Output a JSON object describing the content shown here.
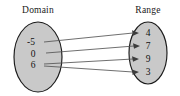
{
  "diagram": {
    "type": "mapping-diagram",
    "domain_label": "Domain",
    "range_label": "Range",
    "domain_elements": [
      "-5",
      "0",
      "6"
    ],
    "range_elements": [
      "4",
      "7",
      "9",
      "3"
    ],
    "mappings": [
      {
        "from": "-5",
        "to": "4"
      },
      {
        "from": "0",
        "to": "7"
      },
      {
        "from": "6",
        "to": "9"
      },
      {
        "from": "6",
        "to": "3"
      }
    ],
    "colors": {
      "oval_fill": "#c9c9c9",
      "oval_stroke": "#1b1b1b",
      "connector": "#555555",
      "arrow": "#3d3d3d",
      "text": "#111111",
      "background": "#ffffff"
    }
  }
}
